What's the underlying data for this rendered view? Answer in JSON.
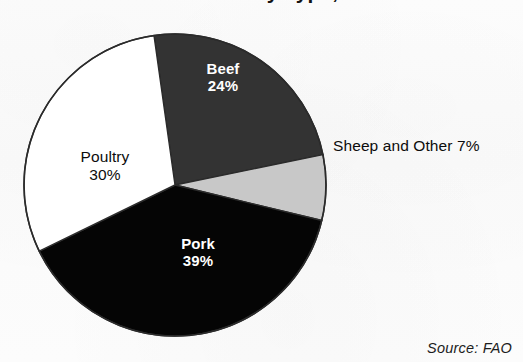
{
  "figure": {
    "title": "Global Meat Production by Type, 2012",
    "title_cropped": true,
    "source_note": "Source: FAO",
    "background_color": "#fbfbfb"
  },
  "chart_data": {
    "type": "pie",
    "title": "Global Meat Production by Type, 2012",
    "xlabel": "",
    "ylabel": "",
    "unit": "percent",
    "total": 100,
    "start_angle_deg": -8,
    "direction": "clockwise",
    "legend": "none",
    "grid": false,
    "labels_inside": true,
    "categories": [
      "Beef",
      "Sheep and Other",
      "Pork",
      "Poultry"
    ],
    "values": [
      24,
      7,
      39,
      30
    ],
    "slices": [
      {
        "name": "Beef",
        "value": 24,
        "value_label": "24%",
        "color": "#333333",
        "text_color": "#ffffff",
        "label_position": "inside"
      },
      {
        "name": "Sheep and Other",
        "value": 7,
        "value_label": "7%",
        "color": "#c8c8c8",
        "text_color": "#0c0c0c",
        "label_position": "outside",
        "outside_label": "Sheep and Other 7%"
      },
      {
        "name": "Pork",
        "value": 39,
        "value_label": "39%",
        "color": "#050505",
        "text_color": "#ffffff",
        "label_position": "inside"
      },
      {
        "name": "Poultry",
        "value": 30,
        "value_label": "30%",
        "color": "#ffffff",
        "text_color": "#0c0c0c",
        "label_position": "inside"
      }
    ],
    "outline_color": "#2b2b2b"
  },
  "labels": {
    "beef": {
      "name": "Beef",
      "pct": "24%"
    },
    "poultry": {
      "name": "Poultry",
      "pct": "30%"
    },
    "pork": {
      "name": "Pork",
      "pct": "39%"
    },
    "sheep": {
      "text": "Sheep and Other 7%"
    }
  }
}
